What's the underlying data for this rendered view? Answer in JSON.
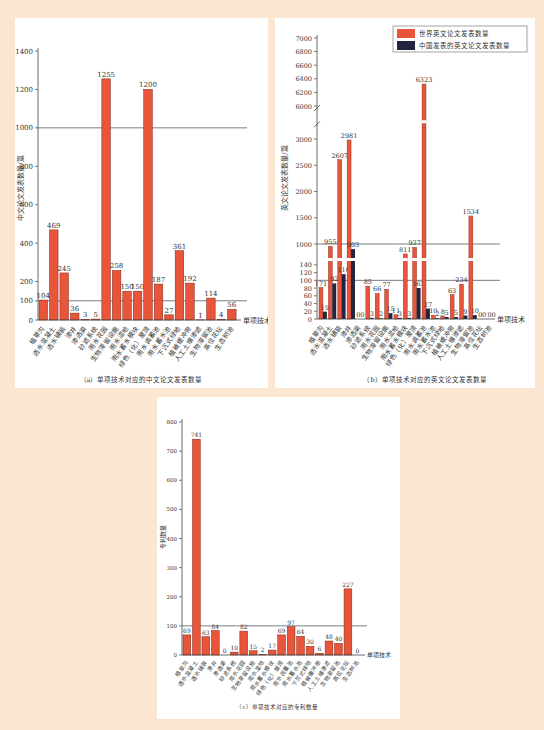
{
  "categories_a": [
    "植草沟",
    "透水混凝土",
    "透水铺装",
    "渗井",
    "渗透渠",
    "砂滤系统",
    "雨水花园",
    "生物滞留设施",
    "雨水湿地",
    "雨水蓄水模块",
    "绿色（化）屋顶",
    "雨水调蓄池",
    "雨水蓄水池",
    "下沉式绿地",
    "植被缓冲带",
    "人工土壤渗滤",
    "生物滞留池",
    "高位花坛",
    "生态树池"
  ],
  "colors": {
    "bar": "#e8553a",
    "bar_stroke": "#7a2a1a",
    "china": "#22253f",
    "ref_line": "#555a66",
    "background": "#fbe6d2"
  },
  "chart_data": [
    {
      "type": "bar",
      "title": "（a）单项技术对应的中文论文发表数量",
      "xlabel": "单项技术",
      "ylabel": "中文论文发表数量/篇",
      "ylim": [
        0,
        1400
      ],
      "yticks": [
        0,
        100,
        200,
        400,
        600,
        800,
        1000,
        1200,
        1400
      ],
      "ref_lines": [
        100,
        1000
      ],
      "categories": [
        "植草沟",
        "透水混凝土",
        "透水铺装",
        "渗井",
        "渗透渠",
        "砂滤系统",
        "雨水花园",
        "生物滞留设施",
        "雨水湿地",
        "雨水蓄水模块",
        "绿色（化）屋顶",
        "雨水调蓄池",
        "雨水蓄水池",
        "下沉式绿地",
        "植被缓冲带",
        "人工土壤渗滤",
        "生物滞留池",
        "高位花坛",
        "生态树池"
      ],
      "values": [
        104,
        469,
        245,
        36,
        3,
        5,
        1255,
        258,
        150,
        150,
        1200,
        187,
        27,
        361,
        192,
        1,
        114,
        4,
        56
      ]
    },
    {
      "type": "bar",
      "title": "（b）单项技术对应的英文论文发表数量",
      "xlabel": "单项技术",
      "ylabel": "英文论文发表数量/篇",
      "axis_break": true,
      "yticks_low": [
        0,
        20,
        40,
        60,
        80,
        100,
        120,
        140
      ],
      "yticks_mid": [
        1000,
        1500,
        2000,
        2500,
        3000
      ],
      "yticks_high": [
        6000,
        6200,
        6400,
        6600,
        6800,
        7000
      ],
      "ref_lines": [
        100,
        1000
      ],
      "legend": [
        "世界英文论文发表数量",
        "中国发表的英文论文发表数量"
      ],
      "legend_position": "upper right",
      "categories": [
        "植草沟",
        "透水混凝土",
        "透水铺装",
        "渗井",
        "渗透渠",
        "砂滤系统",
        "雨水花园",
        "生物滞留设施",
        "雨水湿地",
        "雨水蓄水模块",
        "绿色（化）屋顶",
        "雨水调蓄池",
        "雨水蓄水池",
        "下沉式绿地",
        "植被缓冲带",
        "人工土壤渗滤",
        "生物滞留池",
        "高位花坛",
        "生态树池"
      ],
      "series": [
        {
          "name": "世界英文论文发表数量",
          "values": [
            171,
            955,
            2607,
            2981,
            0,
            85,
            66,
            77,
            11,
            811,
            937,
            6323,
            10,
            8,
            63,
            234,
            1534,
            0,
            0
          ]
        },
        {
          "name": "中国发表的英文论文发表数量",
          "values": [
            19,
            92,
            116,
            903,
            0,
            3,
            2,
            15,
            3,
            3,
            162,
            27,
            2,
            5,
            5,
            9,
            10,
            0,
            0
          ]
        }
      ]
    },
    {
      "type": "bar",
      "title": "（c）单项技术对应的专利数量",
      "xlabel": "单项技术",
      "ylabel": "专利数量",
      "ylim": [
        0,
        800
      ],
      "yticks": [
        0,
        100,
        200,
        300,
        400,
        500,
        600,
        700,
        800
      ],
      "ref_lines": [
        100
      ],
      "categories": [
        "植草沟",
        "透水混凝土",
        "透水铺装",
        "渗井",
        "渗透渠",
        "砂滤系统",
        "雨水花园",
        "生物滞留设施",
        "雨水湿地",
        "雨水蓄水模块",
        "绿色（化）屋顶",
        "雨水调蓄池",
        "雨水蓄水池",
        "下沉式绿地",
        "植被缓冲带",
        "人工土壤渗滤",
        "生物滞留池",
        "高位花坛",
        "生态树池"
      ],
      "values": [
        69,
        741,
        63,
        84,
        0,
        10,
        82,
        15,
        2,
        17,
        69,
        97,
        64,
        30,
        6,
        48,
        40,
        227,
        0
      ]
    }
  ]
}
